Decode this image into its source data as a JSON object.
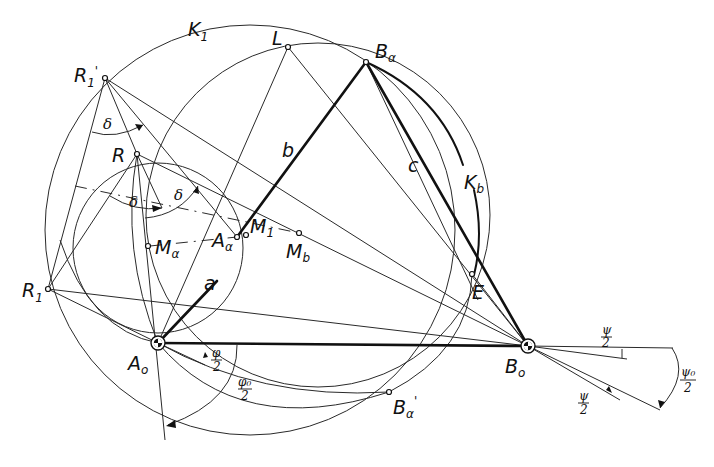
{
  "figure": {
    "type": "geometric construction (four-bar linkage synthesis)",
    "points": {
      "R1_prime": {
        "label": "R",
        "sub": "1",
        "prime": "'"
      },
      "L": {
        "label": "L"
      },
      "B_alpha": {
        "label": "B",
        "sub": "α"
      },
      "R": {
        "label": "R"
      },
      "A_alpha": {
        "label": "A",
        "sub": "α"
      },
      "M1": {
        "label": "M",
        "sub": "1"
      },
      "M_b": {
        "label": "M",
        "sub": "b"
      },
      "M_alpha": {
        "label": "M",
        "sub": "α"
      },
      "R1": {
        "label": "R",
        "sub": "1"
      },
      "A0": {
        "label": "A",
        "sub": "o"
      },
      "B0": {
        "label": "B",
        "sub": "o"
      },
      "E": {
        "label": "E"
      },
      "B_alpha_prime": {
        "label": "B",
        "sub": "α",
        "prime": "'"
      }
    },
    "circles": {
      "K1": {
        "label": "K",
        "sub": "1"
      },
      "Kb": {
        "label": "K",
        "sub": "b"
      }
    },
    "links": {
      "a": "a",
      "b": "b",
      "c": "c"
    },
    "angles": {
      "delta": "δ",
      "phi_half": {
        "num": "φ",
        "den": "2"
      },
      "phi0_half": {
        "num": "φ₀",
        "den": "2"
      },
      "psi_half": {
        "num": "ψ",
        "den": "2"
      },
      "psi0_half": {
        "num": "ψ₀",
        "den": "2"
      }
    }
  }
}
